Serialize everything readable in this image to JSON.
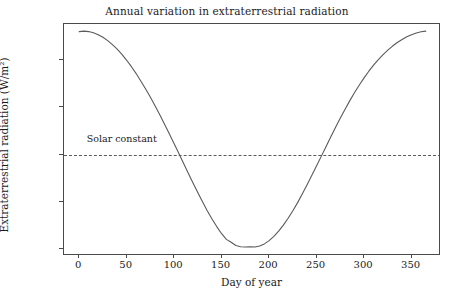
{
  "chart_data": {
    "type": "line",
    "title": "Annual variation in extraterrestrial radiation",
    "xlabel": "Day of year",
    "ylabel": "Extraterrestrial radiation (W/m²)",
    "xlim": [
      -16,
      381
    ],
    "ylim": [
      1317.2,
      1415.0
    ],
    "grid": false,
    "legend": null,
    "x_ticks": [
      0,
      50,
      100,
      150,
      200,
      250,
      300,
      350
    ],
    "x_tick_labels": [
      "0",
      "50",
      "100",
      "150",
      "200",
      "250",
      "300",
      "350"
    ],
    "y_ticks": [
      1320,
      1340,
      1360,
      1380,
      1400
    ],
    "y_tick_labels": [
      "1320",
      "1340",
      "1360",
      "1380",
      "1400"
    ],
    "series": [
      {
        "name": "Extraterrestrial radiation",
        "color": "#5a5a5a",
        "linewidth": 1.1,
        "linestyle": "solid",
        "x": [
          0,
          5,
          10,
          15,
          20,
          25,
          30,
          35,
          40,
          45,
          50,
          55,
          60,
          65,
          70,
          75,
          80,
          85,
          90,
          95,
          100,
          105,
          110,
          115,
          120,
          125,
          130,
          135,
          140,
          145,
          150,
          155,
          160,
          165,
          170,
          175,
          180,
          185,
          190,
          195,
          200,
          205,
          210,
          215,
          220,
          225,
          230,
          235,
          240,
          245,
          250,
          255,
          260,
          265,
          270,
          275,
          280,
          285,
          290,
          295,
          300,
          305,
          310,
          315,
          320,
          325,
          330,
          335,
          340,
          345,
          350,
          355,
          360,
          365
        ],
        "y": [
          1411.8,
          1412.0,
          1411.8,
          1411.3,
          1410.5,
          1409.4,
          1408.0,
          1406.3,
          1404.4,
          1402.2,
          1399.7,
          1397.0,
          1394.1,
          1390.9,
          1387.6,
          1384.1,
          1380.4,
          1376.6,
          1372.6,
          1368.6,
          1364.5,
          1360.4,
          1356.2,
          1352.0,
          1347.9,
          1343.9,
          1340.0,
          1336.2,
          1332.7,
          1329.5,
          1326.6,
          1324.2,
          1323.0,
          1321.6,
          1321.1,
          1321.0,
          1321.1,
          1321.0,
          1321.4,
          1322.3,
          1323.7,
          1325.5,
          1327.7,
          1330.2,
          1333.1,
          1336.3,
          1339.7,
          1343.4,
          1347.2,
          1351.2,
          1355.2,
          1359.3,
          1363.4,
          1367.5,
          1371.5,
          1375.4,
          1379.1,
          1382.7,
          1386.1,
          1389.3,
          1392.3,
          1395.1,
          1397.7,
          1400.0,
          1402.1,
          1404.0,
          1405.7,
          1407.2,
          1408.5,
          1409.6,
          1410.5,
          1411.2,
          1411.7,
          1412.0
        ]
      }
    ],
    "annotations": [
      {
        "name": "solar-constant",
        "label": "Solar constant",
        "value": 1360,
        "style": "dashed-horizontal-line",
        "color": "#5b5b5b",
        "label_x_day": 8
      }
    ]
  }
}
